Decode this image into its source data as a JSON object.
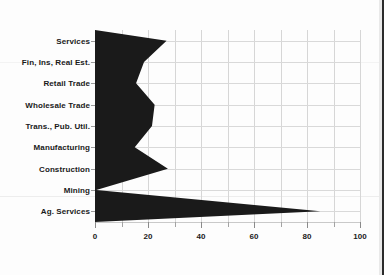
{
  "chart_data": {
    "type": "bar",
    "orientation": "horizontal",
    "title": "",
    "subtitle": "",
    "xlabel": "",
    "ylabel": "",
    "xlim": [
      0,
      100
    ],
    "grid": true,
    "legend": null,
    "series_color": "#1a1a1a",
    "categories": [
      "Services",
      "Fin, Ins, Real Est.",
      "Retail Trade",
      "Wholesale Trade",
      "Trans., Pub. Util.",
      "Manufacturing",
      "Construction",
      "Mining",
      "Ag. Services"
    ],
    "values": [
      27,
      18.5,
      15.5,
      22.5,
      21.5,
      15,
      27.5,
      0.5,
      85
    ],
    "xticks": [
      0,
      10,
      20,
      30,
      40,
      50,
      60,
      70,
      80,
      90,
      100
    ],
    "xtick_labels": [
      "0",
      "",
      "20",
      "",
      "40",
      "",
      "60",
      "",
      "80",
      "",
      "100"
    ]
  }
}
